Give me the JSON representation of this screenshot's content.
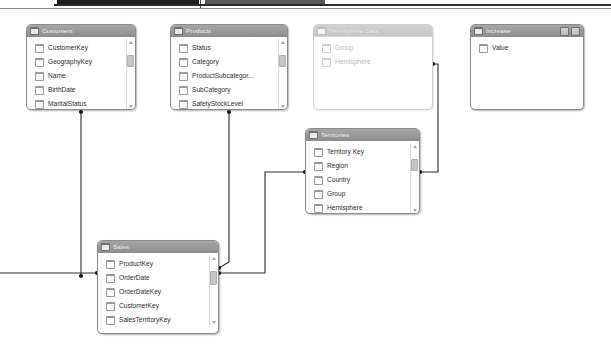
{
  "app": {
    "view": "model-relationship-diagram",
    "background": "#ffffff"
  },
  "colors": {
    "header_gray": "#999999",
    "header_text": "#ffffff",
    "card_border": "#8c8c8c",
    "field_text": "#2c2c2c",
    "wire": "#2e2e2e",
    "faded_text": "#b9b9b9"
  },
  "tables": [
    {
      "id": "customers",
      "title": "Customers",
      "x": 26,
      "y": 24,
      "w": 110,
      "h": 86,
      "faded": false,
      "scrollbar": true,
      "header_buttons": [],
      "fields": [
        {
          "name": "CustomerKey",
          "icon": "table-field-icon"
        },
        {
          "name": "GeographyKey",
          "icon": "table-field-icon"
        },
        {
          "name": "Name",
          "icon": "table-field-icon"
        },
        {
          "name": "BirthDate",
          "icon": "table-field-icon"
        },
        {
          "name": "MaritalStatus",
          "icon": "table-field-icon"
        }
      ]
    },
    {
      "id": "products",
      "title": "Products",
      "x": 170,
      "y": 24,
      "w": 118,
      "h": 86,
      "faded": false,
      "scrollbar": true,
      "header_buttons": [],
      "fields": [
        {
          "name": "Status",
          "icon": "table-field-icon"
        },
        {
          "name": "Category",
          "icon": "table-field-icon"
        },
        {
          "name": "ProductSubcategor...",
          "icon": "table-field-icon"
        },
        {
          "name": "SubCategory",
          "icon": "table-field-icon"
        },
        {
          "name": "SafetyStockLevel",
          "icon": "table-field-icon"
        }
      ]
    },
    {
      "id": "hemisphere-data",
      "title": "Hemisphere Data",
      "x": 313,
      "y": 24,
      "w": 120,
      "h": 86,
      "faded": true,
      "scrollbar": false,
      "header_buttons": [],
      "fields": [
        {
          "name": "Group",
          "icon": "table-field-icon"
        },
        {
          "name": "Hemisphere",
          "icon": "table-field-icon"
        }
      ]
    },
    {
      "id": "increase",
      "title": "Increase",
      "x": 470,
      "y": 24,
      "w": 114,
      "h": 86,
      "faded": false,
      "scrollbar": false,
      "header_buttons": [
        "restore-button",
        "maximize-button"
      ],
      "fields": [
        {
          "name": "Value",
          "icon": "table-field-icon"
        }
      ]
    },
    {
      "id": "territories",
      "title": "Territories",
      "x": 305,
      "y": 128,
      "w": 115,
      "h": 86,
      "faded": false,
      "scrollbar": true,
      "header_buttons": [],
      "fields": [
        {
          "name": "Territory Key",
          "icon": "table-field-icon"
        },
        {
          "name": "Region",
          "icon": "table-field-icon"
        },
        {
          "name": "Country",
          "icon": "table-field-icon"
        },
        {
          "name": "Group",
          "icon": "table-field-icon"
        },
        {
          "name": "Hemisphere",
          "icon": "table-field-icon"
        }
      ]
    },
    {
      "id": "sales",
      "title": "Sales",
      "x": 97,
      "y": 240,
      "w": 122,
      "h": 94,
      "faded": false,
      "scrollbar": true,
      "header_buttons": [],
      "fields": [
        {
          "name": "ProductKey",
          "icon": "table-field-icon"
        },
        {
          "name": "OrderDate",
          "icon": "table-field-icon"
        },
        {
          "name": "OrderDateKey",
          "icon": "table-field-icon"
        },
        {
          "name": "CustomerKey",
          "icon": "table-field-icon"
        },
        {
          "name": "SalesTerritoryKey",
          "icon": "table-field-icon"
        }
      ]
    }
  ],
  "relationships": [
    {
      "id": "sales-to-customers",
      "from": "sales.CustomerKey",
      "to": "customers",
      "path": "M 81,276 L 81,112"
    },
    {
      "id": "sales-left-stub",
      "from": "canvas-left",
      "to": "sales.OrderDateKey",
      "path": "M 0,273 L 97,273"
    },
    {
      "id": "sales-to-products",
      "from": "sales.ProductKey",
      "to": "products",
      "path": "M 219,268 L 229,262 L 229,112"
    },
    {
      "id": "sales-to-territories",
      "from": "sales.SalesTerritoryKey",
      "to": "territories",
      "path": "M 219,273 L 265,273 L 265,172 L 305,172"
    },
    {
      "id": "territories-to-hemisphere",
      "from": "territories",
      "to": "hemisphere-data",
      "path": "M 420,172 L 438,172 L 438,64 L 433,64"
    }
  ]
}
